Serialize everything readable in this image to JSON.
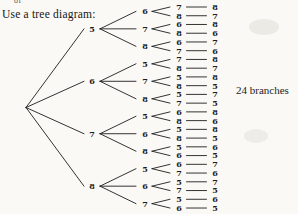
{
  "page": {
    "top_fragment": "of",
    "instruction": "Use a tree diagram:",
    "annotation": "24 branches",
    "background_color": "#faf9f6",
    "ink_color": "#1d1d1d"
  },
  "chart_data": {
    "type": "tree",
    "title": "Use a tree diagram:",
    "annotation": "24 branches",
    "leaf_count": 24,
    "tree": [
      {
        "label": "5",
        "children": [
          {
            "label": "6",
            "children": [
              {
                "label": "7",
                "end": "8"
              },
              {
                "label": "8",
                "end": "7"
              }
            ]
          },
          {
            "label": "7",
            "children": [
              {
                "label": "6",
                "end": "8"
              },
              {
                "label": "8",
                "end": "6"
              }
            ]
          },
          {
            "label": "8",
            "children": [
              {
                "label": "6",
                "end": "7"
              },
              {
                "label": "7",
                "end": "6"
              }
            ]
          }
        ]
      },
      {
        "label": "6",
        "children": [
          {
            "label": "5",
            "children": [
              {
                "label": "7",
                "end": "8"
              },
              {
                "label": "8",
                "end": "7"
              }
            ]
          },
          {
            "label": "7",
            "children": [
              {
                "label": "5",
                "end": "8"
              },
              {
                "label": "8",
                "end": "5"
              }
            ]
          },
          {
            "label": "8",
            "children": [
              {
                "label": "5",
                "end": "7"
              },
              {
                "label": "7",
                "end": "5"
              }
            ]
          }
        ]
      },
      {
        "label": "7",
        "children": [
          {
            "label": "5",
            "children": [
              {
                "label": "6",
                "end": "8"
              },
              {
                "label": "8",
                "end": "6"
              }
            ]
          },
          {
            "label": "6",
            "children": [
              {
                "label": "5",
                "end": "8"
              },
              {
                "label": "8",
                "end": "5"
              }
            ]
          },
          {
            "label": "8",
            "children": [
              {
                "label": "5",
                "end": "6"
              },
              {
                "label": "6",
                "end": "5"
              }
            ]
          }
        ]
      },
      {
        "label": "8",
        "children": [
          {
            "label": "5",
            "children": [
              {
                "label": "6",
                "end": "7"
              },
              {
                "label": "7",
                "end": "6"
              }
            ]
          },
          {
            "label": "6",
            "children": [
              {
                "label": "5",
                "end": "7"
              },
              {
                "label": "7",
                "end": "5"
              }
            ]
          },
          {
            "label": "7",
            "children": [
              {
                "label": "5",
                "end": "6"
              },
              {
                "label": "6",
                "end": "5"
              }
            ]
          }
        ]
      }
    ]
  }
}
